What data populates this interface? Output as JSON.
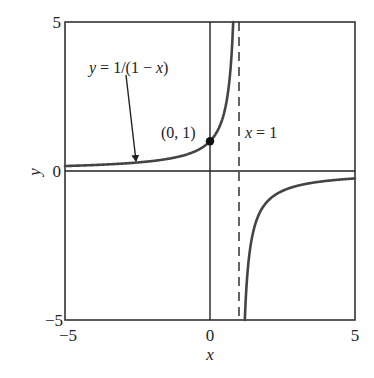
{
  "chart_data": {
    "type": "line",
    "title": "",
    "xlabel": "x",
    "ylabel": "y",
    "xlim": [
      -5,
      5
    ],
    "ylim": [
      -5,
      5
    ],
    "grid": false,
    "xticks": [
      -5,
      0,
      5
    ],
    "xtick_labels": [
      "−5",
      "0",
      "5"
    ],
    "yticks": [
      -5,
      0,
      5
    ],
    "ytick_labels": [
      "−5",
      "0",
      "5"
    ],
    "series": [
      {
        "name": "y = 1/(1 − x)",
        "function": "1/(1-x)",
        "branch_left": {
          "x": [
            -5,
            -4,
            -3,
            -2,
            -1,
            -0.5,
            0,
            0.25,
            0.5,
            0.6,
            0.7,
            0.8
          ],
          "y": [
            0.167,
            0.2,
            0.25,
            0.333,
            0.5,
            0.667,
            1,
            1.333,
            2,
            2.5,
            3.333,
            5
          ]
        },
        "branch_right": {
          "x": [
            1.2,
            1.3,
            1.5,
            2,
            2.5,
            3,
            4,
            5
          ],
          "y": [
            -5,
            -3.333,
            -2,
            -1,
            -0.667,
            -0.5,
            -0.333,
            -0.25
          ]
        },
        "color": "#444444"
      }
    ],
    "reference_lines": [
      {
        "type": "vertical",
        "x": 1,
        "style": "dashed",
        "label": "x = 1"
      },
      {
        "type": "vertical",
        "x": 0,
        "style": "solid",
        "label": ""
      },
      {
        "type": "horizontal",
        "y": 0,
        "style": "solid",
        "label": ""
      }
    ],
    "annotations": [
      {
        "text": "y = 1/(1 − x)",
        "type": "arrow-label",
        "arrow_to": [
          -2.6,
          0.28
        ]
      },
      {
        "text": "(0, 1)",
        "type": "point-label",
        "point": [
          0,
          1
        ]
      },
      {
        "text": "x = 1",
        "type": "line-label"
      }
    ],
    "points": [
      {
        "x": 0,
        "y": 1,
        "marker": "filled-circle"
      }
    ],
    "legend": null
  },
  "labels": {
    "x_axis_title": "x",
    "y_axis_title": "y",
    "x_tick_neg5": "−5",
    "x_tick_0": "0",
    "x_tick_5": "5",
    "y_tick_5": "5",
    "y_tick_0": "0",
    "y_tick_neg5": "−5",
    "curve_label_y": "y",
    "curve_label_rest": " = 1/(1 − ",
    "curve_label_x": "x",
    "curve_label_close": ")",
    "point_label": "(0, 1)",
    "asymptote_label_x": "x",
    "asymptote_label_rest": " = 1"
  },
  "colors": {
    "curve": "#444444",
    "axes": "#222222",
    "frame": "#333333",
    "point": "#111111"
  }
}
